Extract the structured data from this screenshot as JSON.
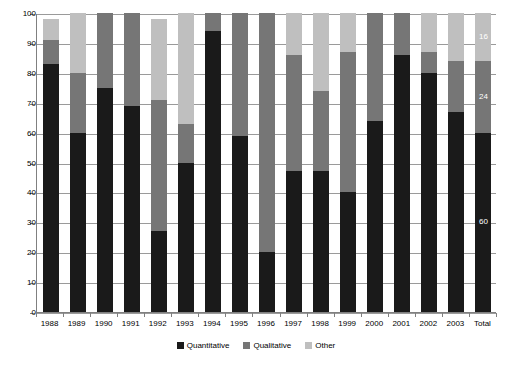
{
  "chart_data": {
    "type": "bar",
    "subtype": "stacked-percent",
    "title": "",
    "xlabel": "",
    "ylabel": "",
    "ylim": [
      0,
      100
    ],
    "ytick_values": [
      0,
      10,
      20,
      30,
      40,
      50,
      60,
      70,
      80,
      90,
      100
    ],
    "ytick_labels": [
      "0",
      "10",
      "20",
      "30",
      "40",
      "50",
      "60",
      "70",
      "80",
      "90",
      "100"
    ],
    "grid": true,
    "legend_position": "bottom",
    "categories": [
      "1988",
      "1989",
      "1990",
      "1991",
      "1992",
      "1993",
      "1994",
      "1995",
      "1996",
      "1997",
      "1998",
      "1999",
      "2000",
      "2001",
      "2002",
      "2003",
      "Total"
    ],
    "series": [
      {
        "name": "Quantitative",
        "color": "#1a1a1a",
        "values": [
          83,
          60,
          75,
          69,
          27,
          50,
          94,
          59,
          20,
          47,
          47,
          40,
          64,
          86,
          80,
          67,
          60
        ]
      },
      {
        "name": "Qualitative",
        "color": "#767676",
        "values": [
          8,
          20,
          25,
          31,
          44,
          13,
          6,
          41,
          80,
          39,
          27,
          47,
          36,
          14,
          7,
          17,
          24
        ]
      },
      {
        "name": "Other",
        "color": "#bfbfbf",
        "values": [
          7,
          20,
          0,
          0,
          27,
          37,
          0,
          0,
          0,
          14,
          26,
          13,
          0,
          0,
          13,
          16,
          16
        ]
      }
    ],
    "data_labels": [
      {
        "category": "Total",
        "series": "Other",
        "value": "16"
      },
      {
        "category": "Total",
        "series": "Qualitative",
        "value": "24"
      },
      {
        "category": "Total",
        "series": "Quantitative",
        "value": "60"
      }
    ],
    "legend": [
      {
        "label": "Quantitative",
        "color": "#1a1a1a"
      },
      {
        "label": "Qualitative",
        "color": "#767676"
      },
      {
        "label": "Other",
        "color": "#bfbfbf"
      }
    ]
  }
}
